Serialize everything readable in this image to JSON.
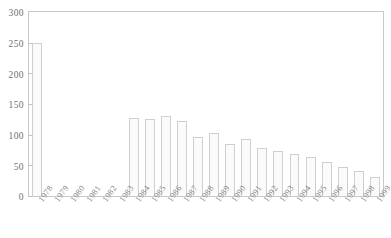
{
  "chart_data": {
    "type": "bar",
    "title": "",
    "subtitle": "",
    "xlabel": "",
    "ylabel": "",
    "ylim": [
      0,
      300
    ],
    "ytick_step": 50,
    "yticks": [
      0,
      50,
      100,
      150,
      200,
      250,
      300
    ],
    "ytick_labels": [
      "0",
      "50",
      "100",
      "150",
      "200",
      "250",
      "300"
    ],
    "grid": false,
    "legend": null,
    "legend_position": "none",
    "bar_fill_color": "#fbfbfb",
    "bar_border_color": "#cfcfcf",
    "axis_color": "#c9c9c9",
    "text_color": "#7a7a7a",
    "categories": [
      "1978",
      "1979",
      "1980",
      "1981",
      "1982",
      "1983",
      "1984",
      "1985",
      "1986",
      "1987",
      "1988",
      "1989",
      "1990",
      "1991",
      "1992",
      "1993",
      "1994",
      "1995",
      "1996",
      "1997",
      "1998",
      "1999"
    ],
    "values": [
      250,
      0,
      0,
      0,
      0,
      0,
      128,
      126,
      130,
      122,
      97,
      103,
      85,
      93,
      79,
      74,
      68,
      63,
      55,
      48,
      40,
      31
    ],
    "xtick_rotation": -55
  }
}
